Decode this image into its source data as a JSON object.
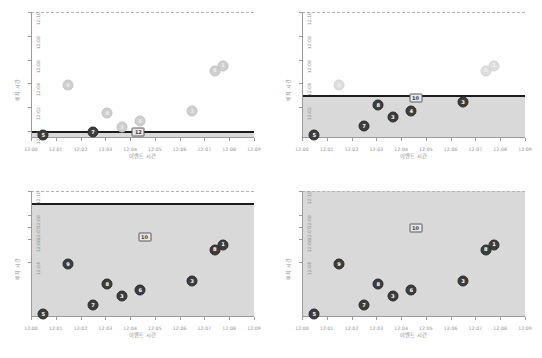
{
  "figure": {
    "caption": "",
    "xlabel": "이벤트 시간",
    "ylabel": "배치 시간",
    "xticks": [
      "12:00",
      "12:01",
      "12:02",
      "12:03",
      "12:04",
      "12:05",
      "12:06",
      "12:07",
      "12:08",
      "12:09"
    ],
    "colors": {
      "shaded_region": "#d9d9d9",
      "threshold_line": "#1c1c1c",
      "marker_dark": "#3d3d3d",
      "marker_mid": "#9e9e9e",
      "marker_light": "#cfcfcf",
      "axis": "#9a9a9a",
      "tick_text": "#8d8d8d"
    }
  },
  "chart_data": [
    {
      "type": "scatter",
      "panel": "top-left",
      "title": "",
      "xlabel": "이벤트 시간",
      "ylabel": "배치 시간",
      "xlim": [
        "12:00",
        "12:09"
      ],
      "ylim": [
        "12:00",
        "12:10"
      ],
      "xticks": [
        "12:00",
        "12:01",
        "12:02",
        "12:03",
        "12:04",
        "12:05",
        "12:06",
        "12:07",
        "12:08",
        "12:09"
      ],
      "yticks": [
        "12:00",
        "12:02",
        "12:04",
        "12:06",
        "12:08",
        "12:10"
      ],
      "grid": false,
      "legend": "none",
      "watermark_threshold": "12:00",
      "shaded_region_label": "처리 완료 영역",
      "points": [
        {
          "label": "5",
          "x": "12:00:30",
          "y": "11:59:40",
          "style": "dark"
        },
        {
          "label": "7",
          "x": "12:02:30",
          "y": "11:59:55",
          "style": "dark"
        },
        {
          "label": "12",
          "x": "12:04:20",
          "y": "11:59:55",
          "style": "boxed"
        },
        {
          "label": "3",
          "x": "12:03:40",
          "y": "12:00:20",
          "style": "light"
        },
        {
          "label": "6",
          "x": "12:04:25",
          "y": "12:00:50",
          "style": "light"
        },
        {
          "label": "8",
          "x": "12:03:05",
          "y": "12:01:30",
          "style": "light"
        },
        {
          "label": "3",
          "x": "12:06:30",
          "y": "12:01:40",
          "style": "light"
        },
        {
          "label": "9",
          "x": "12:01:30",
          "y": "12:03:50",
          "style": "light"
        },
        {
          "label": "8",
          "x": "12:07:25",
          "y": "12:05:05",
          "style": "light"
        },
        {
          "label": "1",
          "x": "12:07:45",
          "y": "12:05:30",
          "style": "light"
        }
      ]
    },
    {
      "type": "scatter",
      "panel": "top-right",
      "title": "",
      "xlabel": "이벤트 시간",
      "ylabel": "배치 시간",
      "xlim": [
        "12:00",
        "12:09"
      ],
      "ylim": [
        "12:00",
        "12:10"
      ],
      "xticks": [
        "12:00",
        "12:01",
        "12:02",
        "12:03",
        "12:04",
        "12:05",
        "12:06",
        "12:07",
        "12:08",
        "12:09"
      ],
      "yticks": [
        "12:02",
        "12:04",
        "12:06",
        "12:08",
        "12:10"
      ],
      "grid": false,
      "legend": "none",
      "watermark_threshold": "12:03",
      "points": [
        {
          "label": "5",
          "x": "12:00:30",
          "y": "11:59:40",
          "style": "dark"
        },
        {
          "label": "7",
          "x": "12:02:30",
          "y": "12:00:25",
          "style": "dark"
        },
        {
          "label": "3",
          "x": "12:03:40",
          "y": "12:01:10",
          "style": "dark"
        },
        {
          "label": "4",
          "x": "12:04:25",
          "y": "12:01:40",
          "style": "dark"
        },
        {
          "label": "8",
          "x": "12:03:05",
          "y": "12:02:10",
          "style": "dark"
        },
        {
          "label": "3",
          "x": "12:06:30",
          "y": "12:02:25",
          "style": "dark"
        },
        {
          "label": "10",
          "x": "12:04:35",
          "y": "12:02:45",
          "style": "boxed"
        },
        {
          "label": "9",
          "x": "12:01:30",
          "y": "12:03:50",
          "style": "faint"
        },
        {
          "label": "8",
          "x": "12:07:25",
          "y": "12:05:05",
          "style": "faint"
        },
        {
          "label": "1",
          "x": "12:07:45",
          "y": "12:05:30",
          "style": "faint"
        }
      ]
    },
    {
      "type": "scatter",
      "panel": "bottom-left",
      "title": "",
      "xlabel": "이벤트 시간",
      "ylabel": "배치 시간",
      "xlim": [
        "12:00",
        "12:09"
      ],
      "ylim": [
        "12:00",
        "12:10"
      ],
      "xticks": [
        "12:00",
        "12:01",
        "12:02",
        "12:03",
        "12:04",
        "12:05",
        "12:06",
        "12:07",
        "12:08",
        "12:09"
      ],
      "yticks": [
        "12:04",
        "12:06",
        "12:07",
        "12:08",
        "12:10"
      ],
      "grid": false,
      "legend": "none",
      "watermark_threshold": "12:09",
      "points": [
        {
          "label": "5",
          "x": "12:00:30",
          "y": "11:59:40",
          "style": "dark"
        },
        {
          "label": "7",
          "x": "12:02:30",
          "y": "12:00:25",
          "style": "dark"
        },
        {
          "label": "3",
          "x": "12:03:40",
          "y": "12:01:10",
          "style": "dark"
        },
        {
          "label": "6",
          "x": "12:04:25",
          "y": "12:01:40",
          "style": "dark"
        },
        {
          "label": "8",
          "x": "12:03:05",
          "y": "12:02:10",
          "style": "dark"
        },
        {
          "label": "3",
          "x": "12:06:30",
          "y": "12:02:25",
          "style": "dark"
        },
        {
          "label": "9",
          "x": "12:01:30",
          "y": "12:03:50",
          "style": "dark"
        },
        {
          "label": "8",
          "x": "12:07:25",
          "y": "12:05:05",
          "style": "dark"
        },
        {
          "label": "1",
          "x": "12:07:45",
          "y": "12:05:30",
          "style": "dark"
        },
        {
          "label": "10",
          "x": "12:04:35",
          "y": "12:06:10",
          "style": "boxed"
        }
      ]
    },
    {
      "type": "scatter",
      "panel": "bottom-right",
      "title": "",
      "xlabel": "이벤트 시간",
      "ylabel": "배치 시간",
      "xlim": [
        "12:00",
        "12:09"
      ],
      "ylim": [
        "12:00",
        "12:10"
      ],
      "xticks": [
        "12:00",
        "12:01",
        "12:02",
        "12:03",
        "12:04",
        "12:05",
        "12:06",
        "12:07",
        "12:08",
        "12:09"
      ],
      "yticks": [
        "12:04",
        "12:06",
        "12:07",
        "12:08",
        "12:10"
      ],
      "grid": false,
      "legend": "none",
      "watermark_threshold": "12:10",
      "points": [
        {
          "label": "5",
          "x": "12:00:30",
          "y": "11:59:40",
          "style": "dark"
        },
        {
          "label": "7",
          "x": "12:02:30",
          "y": "12:00:25",
          "style": "dark"
        },
        {
          "label": "3",
          "x": "12:03:40",
          "y": "12:01:10",
          "style": "dark"
        },
        {
          "label": "6",
          "x": "12:04:25",
          "y": "12:01:40",
          "style": "dark"
        },
        {
          "label": "8",
          "x": "12:03:05",
          "y": "12:02:10",
          "style": "dark"
        },
        {
          "label": "3",
          "x": "12:06:30",
          "y": "12:02:25",
          "style": "dark"
        },
        {
          "label": "9",
          "x": "12:01:30",
          "y": "12:03:50",
          "style": "dark"
        },
        {
          "label": "8",
          "x": "12:07:25",
          "y": "12:05:05",
          "style": "dark"
        },
        {
          "label": "1",
          "x": "12:07:45",
          "y": "12:05:30",
          "style": "dark"
        },
        {
          "label": "10",
          "x": "12:04:35",
          "y": "12:06:55",
          "style": "boxed"
        }
      ]
    }
  ]
}
